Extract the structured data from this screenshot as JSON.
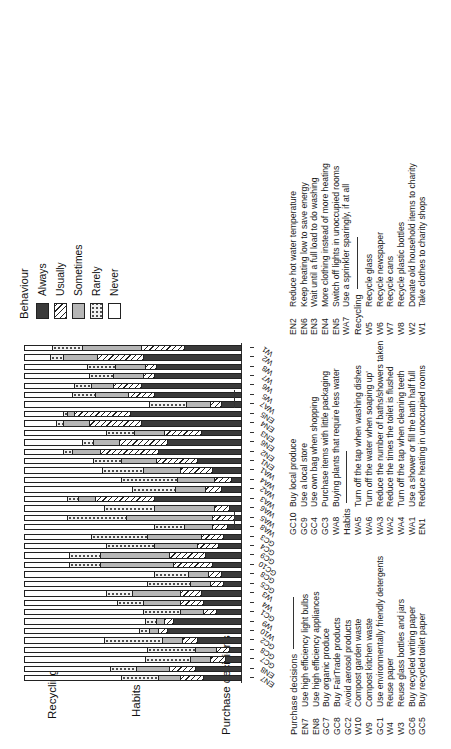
{
  "figure": {
    "groups": [
      {
        "name": "Purchase decisions"
      },
      {
        "name": "Habits"
      },
      {
        "name": "Recycling"
      }
    ]
  },
  "legend": {
    "title": "Behaviour",
    "items": [
      {
        "label": "Always",
        "pattern": "solid-dark",
        "color": "#3a3a3a"
      },
      {
        "label": "Usually",
        "pattern": "diagonal-hatch",
        "color": "#ffffff"
      },
      {
        "label": "Sometimes",
        "pattern": "solid-gray",
        "color": "#b6b6b6"
      },
      {
        "label": "Rarely",
        "pattern": "dotted",
        "color": "#f2f2f2"
      },
      {
        "label": "Never",
        "pattern": "empty",
        "color": "#ffffff"
      }
    ]
  },
  "keys": {
    "col1": {
      "heading": "Purchase decisions",
      "items": [
        {
          "code": "EN7",
          "text": "Use high efficiency light bulbs"
        },
        {
          "code": "EN8",
          "text": "Use high efficiency appliances"
        },
        {
          "code": "GC7",
          "text": "Buy organic produce"
        },
        {
          "code": "GC8",
          "text": "Buy FairTrade products"
        },
        {
          "code": "GC2",
          "text": "Avoid aerosol products"
        },
        {
          "code": "W10",
          "text": "Compost garden waste"
        },
        {
          "code": "W9",
          "text": "Compost kitchen waste"
        },
        {
          "code": "GC1",
          "text": "Use environmentally friendly detergents"
        },
        {
          "code": "W4",
          "text": "Reuse paper"
        },
        {
          "code": "W3",
          "text": "Reuse glass bottles and jars"
        },
        {
          "code": "GC6",
          "text": "Buy recycled writing paper"
        },
        {
          "code": "GC5",
          "text": "Buy recycled toilet paper"
        }
      ]
    },
    "col2": {
      "heading": "",
      "items": [
        {
          "code": "GC10",
          "text": "Buy local produce"
        },
        {
          "code": "GC9",
          "text": "Use a local store"
        },
        {
          "code": "GC4",
          "text": "Use own bag when shopping"
        },
        {
          "code": "GC3",
          "text": "Purchase items with little packaging"
        },
        {
          "code": "WA8",
          "text": "Buying plants that require less water"
        }
      ],
      "heading2": "Habits",
      "items2": [
        {
          "code": "WA5",
          "text": "Turn off the tap when washing dishes"
        },
        {
          "code": "WA6",
          "text": "Turn off the water when soaping up'"
        },
        {
          "code": "WA3",
          "text": "Reduce the number of baths/showers taken"
        },
        {
          "code": "WA2",
          "text": "Reduce the times the toilet is flushed"
        },
        {
          "code": "WA4",
          "text": "Turn off the tap when cleaning teeth"
        },
        {
          "code": "WA1",
          "text": "Use a shower or fill the bath half full"
        },
        {
          "code": "EN1",
          "text": "Reduce heating in unoccupied rooms"
        }
      ]
    },
    "col3": {
      "heading": "",
      "items": [
        {
          "code": "EN2",
          "text": "Reduce hot water temperature"
        },
        {
          "code": "EN6",
          "text": "Keep heating low to save energy"
        },
        {
          "code": "EN3",
          "text": "Wait until a full load to do washing"
        },
        {
          "code": "EN4",
          "text": "More clothing instead of more heating"
        },
        {
          "code": "EN5",
          "text": "Switch off lights in unoccupied rooms"
        },
        {
          "code": "WA7",
          "text": "Use a sprinkler sparingly, if at all"
        }
      ],
      "heading2": "Recycling",
      "items2": [
        {
          "code": "W5",
          "text": "Recycle glass"
        },
        {
          "code": "W6",
          "text": "Recycle newspaper"
        },
        {
          "code": "W7",
          "text": "Recycle cans"
        },
        {
          "code": "W8",
          "text": "Recycle plastic bottles"
        },
        {
          "code": "W2",
          "text": "Donate old household items to charity"
        },
        {
          "code": "W1",
          "text": "Take clothes to charity shops"
        }
      ]
    }
  },
  "chart_data": {
    "type": "bar",
    "orientation": "horizontal-stacked",
    "title": "",
    "xlabel": "",
    "ylabel": "",
    "grid": false,
    "legend_position": "right",
    "series": [
      {
        "name": "Always",
        "color": "#3a3a3a"
      },
      {
        "name": "Usually",
        "color": "#ffffff"
      },
      {
        "name": "Sometimes",
        "color": "#b6b6b6"
      },
      {
        "name": "Rarely",
        "color": "#f2f2f2"
      },
      {
        "name": "Never",
        "color": "#ffffff"
      }
    ],
    "categories": [
      "EN7",
      "EN8",
      "GC7",
      "GC8",
      "GC2",
      "W10",
      "W9",
      "GC1",
      "W4",
      "W3",
      "GC5",
      "GC8b",
      "GC10",
      "GC9",
      "GC4",
      "GC3",
      "WA8",
      "WA5",
      "WA6",
      "WA3",
      "WA2",
      "WA4",
      "WA1",
      "EN1",
      "EN2",
      "EN6",
      "EN3",
      "EN4",
      "EN5",
      "WA7",
      "W5",
      "W6",
      "W7",
      "W8",
      "W2",
      "W1"
    ],
    "groups": [
      {
        "name": "Purchase decisions",
        "from": "EN7",
        "to": "WA8"
      },
      {
        "name": "Habits",
        "from": "WA5",
        "to": "WA7"
      },
      {
        "name": "Recycling",
        "from": "W5",
        "to": "W1"
      }
    ],
    "values": [
      {
        "cat": "EN7",
        "always": 17,
        "usually": 11,
        "sometimes": 10,
        "rarely": 17,
        "never": 45
      },
      {
        "cat": "EN8",
        "always": 21,
        "usually": 12,
        "sometimes": 15,
        "rarely": 12,
        "never": 40
      },
      {
        "cat": "GC7",
        "always": 7,
        "usually": 7,
        "sometimes": 9,
        "rarely": 21,
        "never": 56
      },
      {
        "cat": "GC8",
        "always": 5,
        "usually": 6,
        "sometimes": 10,
        "rarely": 22,
        "never": 57
      },
      {
        "cat": "GC2",
        "always": 20,
        "usually": 7,
        "sometimes": 9,
        "rarely": 27,
        "never": 37
      },
      {
        "cat": "W10",
        "always": 34,
        "usually": 4,
        "sometimes": 4,
        "rarely": 5,
        "never": 53
      },
      {
        "cat": "W9",
        "always": 31,
        "usually": 4,
        "sometimes": 4,
        "rarely": 5,
        "never": 56
      },
      {
        "cat": "GC1",
        "always": 11,
        "usually": 6,
        "sometimes": 11,
        "rarely": 17,
        "never": 55
      },
      {
        "cat": "W4",
        "always": 17,
        "usually": 11,
        "sometimes": 17,
        "rarely": 12,
        "never": 43
      },
      {
        "cat": "W3",
        "always": 18,
        "usually": 10,
        "sometimes": 22,
        "rarely": 12,
        "never": 38
      },
      {
        "cat": "GC5",
        "always": 8,
        "usually": 6,
        "sometimes": 9,
        "rarely": 20,
        "never": 57
      },
      {
        "cat": "GC8b",
        "always": 9,
        "usually": 6,
        "sometimes": 9,
        "rarely": 16,
        "never": 60
      },
      {
        "cat": "GC10",
        "always": 13,
        "usually": 18,
        "sometimes": 34,
        "rarely": 14,
        "never": 21
      },
      {
        "cat": "GC9",
        "always": 16,
        "usually": 17,
        "sometimes": 32,
        "rarely": 14,
        "never": 21
      },
      {
        "cat": "GC4",
        "always": 10,
        "usually": 10,
        "sometimes": 20,
        "rarely": 22,
        "never": 38
      },
      {
        "cat": "GC3",
        "always": 8,
        "usually": 10,
        "sometimes": 25,
        "rarely": 26,
        "never": 31
      },
      {
        "cat": "WA8",
        "always": 6,
        "usually": 7,
        "sometimes": 13,
        "rarely": 14,
        "never": 60
      },
      {
        "cat": "WA5",
        "always": 3,
        "usually": 10,
        "sometimes": 40,
        "rarely": 27,
        "never": 20
      },
      {
        "cat": "WA6",
        "always": 5,
        "usually": 7,
        "sometimes": 28,
        "rarely": 23,
        "never": 37
      },
      {
        "cat": "WA3",
        "always": 40,
        "usually": 27,
        "sometimes": 8,
        "rarely": 5,
        "never": 20
      },
      {
        "cat": "WA2",
        "always": 9,
        "usually": 7,
        "sometimes": 14,
        "rarely": 20,
        "never": 50
      },
      {
        "cat": "WA4",
        "always": 4,
        "usually": 8,
        "sometimes": 17,
        "rarely": 26,
        "never": 45
      },
      {
        "cat": "WA1",
        "always": 13,
        "usually": 15,
        "sometimes": 17,
        "rarely": 19,
        "never": 36
      },
      {
        "cat": "EN1",
        "always": 20,
        "usually": 19,
        "sometimes": 16,
        "rarely": 13,
        "never": 32
      },
      {
        "cat": "EN2",
        "always": 38,
        "usually": 27,
        "sometimes": 13,
        "rarely": 4,
        "never": 18
      },
      {
        "cat": "EN6",
        "always": 34,
        "usually": 22,
        "sometimes": 12,
        "rarely": 5,
        "never": 27
      },
      {
        "cat": "EN3",
        "always": 18,
        "usually": 17,
        "sometimes": 14,
        "rarely": 13,
        "never": 38
      },
      {
        "cat": "EN4",
        "always": 46,
        "usually": 24,
        "sometimes": 12,
        "rarely": 3,
        "never": 15
      },
      {
        "cat": "EN5",
        "always": 51,
        "usually": 26,
        "sometimes": 3,
        "rarely": 2,
        "never": 18
      },
      {
        "cat": "WA7",
        "always": 9,
        "usually": 5,
        "sometimes": 11,
        "rarely": 17,
        "never": 58
      },
      {
        "cat": "W5",
        "always": 40,
        "usually": 12,
        "sometimes": 15,
        "rarely": 11,
        "never": 22
      },
      {
        "cat": "W6",
        "always": 46,
        "usually": 13,
        "sometimes": 10,
        "rarely": 8,
        "never": 23
      },
      {
        "cat": "W7",
        "always": 40,
        "usually": 5,
        "sometimes": 14,
        "rarely": 11,
        "never": 30
      },
      {
        "cat": "W8",
        "always": 39,
        "usually": 5,
        "sometimes": 14,
        "rarely": 13,
        "never": 29
      },
      {
        "cat": "W2",
        "always": 45,
        "usually": 21,
        "sometimes": 16,
        "rarely": 6,
        "never": 12
      },
      {
        "cat": "W1",
        "always": 26,
        "usually": 20,
        "sometimes": 27,
        "rarely": 14,
        "never": 13
      }
    ]
  }
}
